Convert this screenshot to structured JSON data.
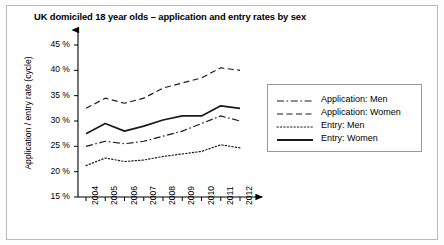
{
  "title": "UK domiciled 18 year olds – application and entry rates by sex",
  "axis": {
    "ylabel": "Application / entry rate (cycle)",
    "yticks": [
      "15 %",
      "20 %",
      "25 %",
      "30 %",
      "35 %",
      "40 %",
      "45 %"
    ],
    "xticks": [
      "2004",
      "2005",
      "2006",
      "2007",
      "2008",
      "2009",
      "2010",
      "2011",
      "2012"
    ]
  },
  "legend": [
    {
      "label": "Application: Men",
      "style": "dash-dot"
    },
    {
      "label": "Application: Women",
      "style": "dashed"
    },
    {
      "label": "Entry: Men",
      "style": "dotted"
    },
    {
      "label": "Entry: Women",
      "style": "solid"
    }
  ],
  "chart_data": {
    "type": "line",
    "title": "UK domiciled 18 year olds – application and entry rates by sex",
    "xlabel": "",
    "ylabel": "Application / entry rate (cycle)",
    "categories": [
      "2004",
      "2005",
      "2006",
      "2007",
      "2008",
      "2009",
      "2010",
      "2011",
      "2012"
    ],
    "x": [
      2004,
      2005,
      2006,
      2007,
      2008,
      2009,
      2010,
      2011,
      2012
    ],
    "ylim": [
      15,
      45
    ],
    "ytick_values": [
      15,
      20,
      25,
      30,
      35,
      40,
      45
    ],
    "yunit": "%",
    "grid": false,
    "legend_position": "right",
    "series": [
      {
        "name": "Application: Men",
        "style": "dash-dot",
        "color": "#1a1a1a",
        "values": [
          25.0,
          26.0,
          25.5,
          26.0,
          27.0,
          28.0,
          29.5,
          31.0,
          30.0
        ]
      },
      {
        "name": "Application: Women",
        "style": "dashed",
        "color": "#1a1a1a",
        "values": [
          32.5,
          34.5,
          33.5,
          34.5,
          36.5,
          37.5,
          38.5,
          40.5,
          40.0
        ]
      },
      {
        "name": "Entry: Men",
        "style": "dotted",
        "color": "#1a1a1a",
        "values": [
          21.2,
          22.7,
          22.0,
          22.3,
          23.0,
          23.5,
          24.0,
          25.3,
          24.7
        ]
      },
      {
        "name": "Entry: Women",
        "style": "solid",
        "color": "#1a1a1a",
        "values": [
          27.5,
          29.5,
          28.0,
          29.0,
          30.2,
          31.0,
          31.0,
          33.0,
          32.5
        ]
      }
    ]
  }
}
